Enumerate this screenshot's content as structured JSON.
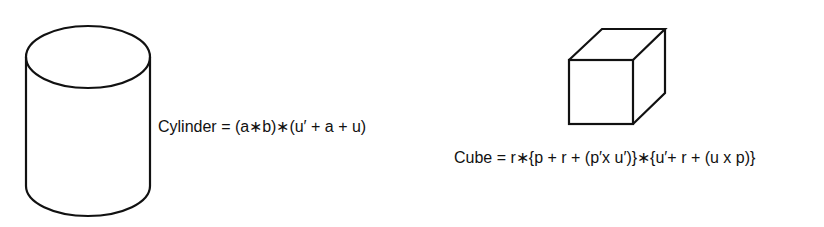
{
  "diagram": {
    "shapes": [
      {
        "name": "cylinder",
        "formula": "Cylinder = (a∗b)∗(u′ + a + u)"
      },
      {
        "name": "cube",
        "formula": "Cube = r∗{p + r + (p′x u′)}∗{u′+ r + (u x p)}"
      }
    ],
    "stroke_color": "#111111",
    "background_color": "#ffffff"
  }
}
